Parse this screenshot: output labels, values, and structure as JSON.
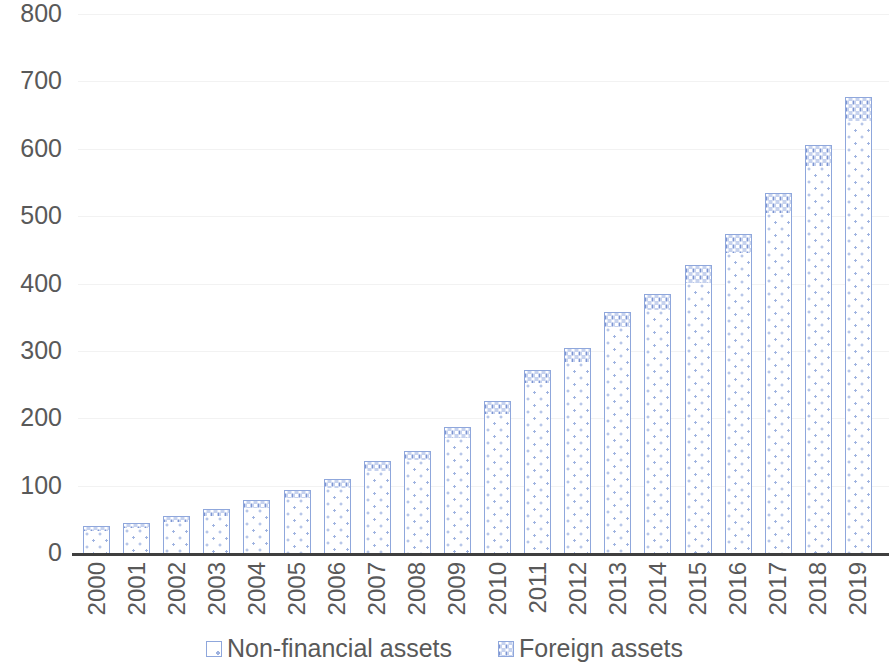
{
  "chart_data": {
    "type": "bar",
    "subtype": "stacked-column",
    "title": "",
    "subtitle": "",
    "xlabel": "",
    "ylabel": "",
    "ylim": [
      0,
      800
    ],
    "ytick_step": 100,
    "ytick_labels": [
      "0",
      "100",
      "200",
      "300",
      "400",
      "500",
      "600",
      "700",
      "800"
    ],
    "grid": true,
    "grid_axis": "y",
    "legend_position": "bottom-center",
    "categories": [
      "2000",
      "2001",
      "2002",
      "2003",
      "2004",
      "2005",
      "2006",
      "2007",
      "2008",
      "2009",
      "2010",
      "2011",
      "2012",
      "2013",
      "2014",
      "2015",
      "2016",
      "2017",
      "2018",
      "2019"
    ],
    "series": [
      {
        "name": "Non-financial assets",
        "color": "#ffffff",
        "pattern": "sparse-dots",
        "values": [
          33,
          37,
          46,
          55,
          67,
          81,
          97,
          122,
          138,
          170,
          207,
          252,
          284,
          335,
          361,
          401,
          446,
          505,
          574,
          641
        ]
      },
      {
        "name": "Foreign assets",
        "color": "#c6d2ee",
        "pattern": "dense-checker-dots",
        "values": [
          7,
          8,
          9,
          10,
          11,
          12,
          13,
          15,
          14,
          17,
          18,
          20,
          21,
          23,
          24,
          26,
          28,
          30,
          32,
          36
        ]
      }
    ],
    "totals": [
      40,
      45,
      55,
      65,
      78,
      93,
      110,
      137,
      152,
      187,
      225,
      272,
      305,
      358,
      385,
      427,
      474,
      535,
      606,
      677
    ],
    "colors": {
      "axis_line": "#3f3f3f",
      "gridline": "#f2f2f2",
      "bar_stroke": "#8fa7dc",
      "text": "#595959",
      "accent": "#7d95d2"
    }
  },
  "legend": {
    "items": [
      {
        "label": "Non-financial assets",
        "swatch": "nonfin"
      },
      {
        "label": "Foreign assets",
        "swatch": "foreign"
      }
    ]
  }
}
